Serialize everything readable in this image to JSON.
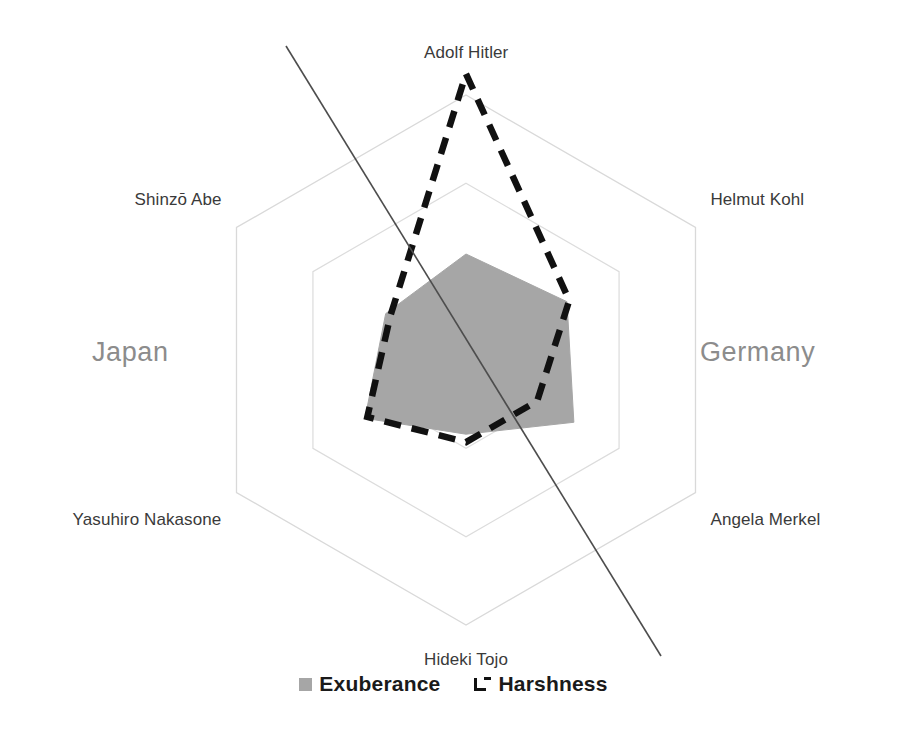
{
  "chart_data": {
    "type": "radar",
    "title": "",
    "categories": [
      "Adolf Hitler",
      "Helmut Kohl",
      "Angela Merkel",
      "Hideki Tojo",
      "Yasuhiro Nakasone",
      "Shinzō Abe"
    ],
    "axis_angles_deg": [
      90,
      30,
      -30,
      -90,
      -150,
      150
    ],
    "rings": 3,
    "ring_radii_fraction": [
      0.333,
      0.667,
      1.0
    ],
    "grid": true,
    "grid_color": "#d9d9d9",
    "rmax": 1.0,
    "legend_position": "bottom",
    "series": [
      {
        "name": "Exuberance",
        "style": "filled",
        "fill_color": "#a6a6a6",
        "line_color": "#a6a6a6",
        "values": [
          0.4,
          0.44,
          0.47,
          0.28,
          0.44,
          0.35
        ]
      },
      {
        "name": "Harshness",
        "style": "dashed-outline",
        "fill_color": "none",
        "line_color": "#111111",
        "values": [
          1.08,
          0.45,
          0.31,
          0.31,
          0.43,
          0.33
        ]
      }
    ],
    "annotations": [
      {
        "name": "trend-line",
        "type": "line",
        "color": "#4d4d4d",
        "x1": 286,
        "y1": 46,
        "x2": 661,
        "y2": 656
      }
    ]
  },
  "groups": [
    {
      "label": "Japan",
      "side": "left"
    },
    {
      "label": "Germany",
      "side": "right"
    }
  ],
  "legend": {
    "items": [
      {
        "label": "Exuberance",
        "marker": "filled-square-swatch",
        "color": "#a6a6a6"
      },
      {
        "label": "Harshness",
        "marker": "dashed-outline-swatch",
        "color": "#111111"
      }
    ]
  },
  "colors": {
    "background": "#ffffff",
    "exuberance": "#a6a6a6",
    "harshness": "#111111",
    "grid": "#d9d9d9",
    "axis_label": "#3a3a3a",
    "group_label": "#8c8c8c",
    "trend_line": "#4d4d4d"
  }
}
